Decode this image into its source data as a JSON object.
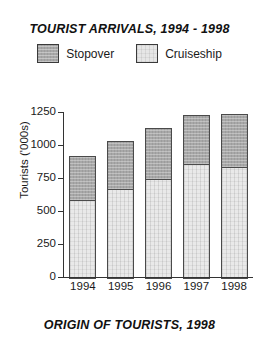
{
  "chart_data": {
    "type": "bar",
    "title": "TOURIST ARRIVALS, 1994 - 1998",
    "caption": "ORIGIN OF TOURISTS, 1998",
    "stacked": true,
    "grid": false,
    "legend_position": "top",
    "xlabel": "",
    "ylabel": "Tourists ('000s)",
    "ylim": [
      0,
      1250
    ],
    "ytick_labels": [
      "1250",
      "1000",
      "750",
      "500",
      "250",
      "0"
    ],
    "ytick_values": [
      1250,
      1000,
      750,
      500,
      250,
      0
    ],
    "categories": [
      "1994",
      "1995",
      "1996",
      "1997",
      "1998"
    ],
    "series": [
      {
        "name": "Cruiseship",
        "values": [
          600,
          680,
          760,
          870,
          850
        ]
      },
      {
        "name": "Stopover",
        "values": [
          340,
          370,
          390,
          380,
          405
        ]
      }
    ],
    "totals": [
      940,
      1050,
      1150,
      1250,
      1255
    ],
    "colors": {
      "stopover": "#a8a8a8",
      "cruiseship": "#e9e9e9",
      "axis": "#333333",
      "text": "#1a1a1a"
    }
  },
  "legend": {
    "items": [
      {
        "label": "Stopover",
        "swatch": "stopover-swatch"
      },
      {
        "label": "Cruiseship",
        "swatch": "cruiseship-swatch"
      }
    ]
  }
}
